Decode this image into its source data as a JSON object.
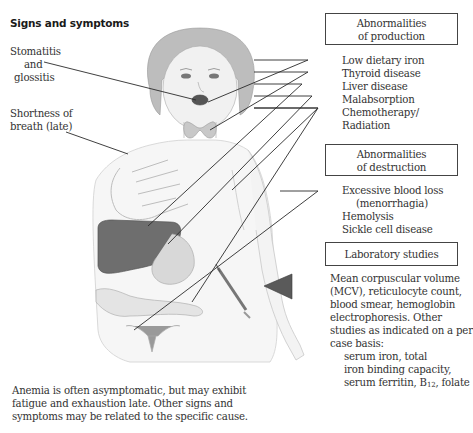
{
  "title": "Signs and symptoms",
  "left_labels": {
    "stomatitis": [
      "Stomatitis",
      "and",
      "glossitis"
    ],
    "shortness": [
      "Shortness of",
      "breath (late)"
    ]
  },
  "production": {
    "box_lines": [
      "Abnormalities",
      "of production"
    ],
    "items": [
      "Low dietary iron",
      "Thyroid disease",
      "Liver disease",
      "Malabsorption",
      "Chemotherapy/",
      "Radiation"
    ]
  },
  "destruction": {
    "box_lines": [
      "Abnormalities",
      "of destruction"
    ],
    "items": [
      "Excessive blood loss",
      "(menorrhagia)",
      "Hemolysis",
      "Sickle cell disease"
    ]
  },
  "lab": {
    "box_label": "Laboratory studies",
    "lines": [
      "Mean corpuscular volume",
      "(MCV), reticulocyte count,",
      "blood smear, hemoglobin",
      "electrophoresis. Other",
      "studies as indicated on a per",
      "case basis:"
    ],
    "indented": [
      "serum iron, total",
      "iron binding capacity,"
    ],
    "last_line_prefix": "serum ferritin, B",
    "last_line_sub": "12",
    "last_line_suffix": ", folate"
  },
  "footer": [
    "Anemia is often asymptomatic, but may exhibit",
    "fatigue and exhaustion late. Other signs and",
    "symptoms may be related to the specific cause."
  ],
  "colors": {
    "line": "#2a2a2a",
    "organ": "#6e6e6e",
    "pointer": "#5a5a5a",
    "box_border": "#444444"
  }
}
